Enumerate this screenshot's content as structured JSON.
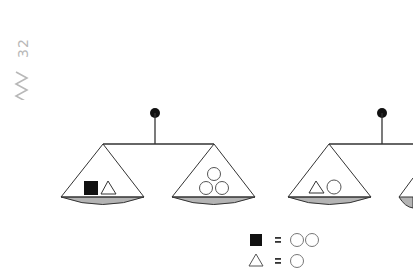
{
  "page": {
    "number": "32",
    "decoration": "zigzag"
  },
  "scales": [
    {
      "id": "scale-1",
      "left_pan": [
        "filled-square",
        "triangle"
      ],
      "right_pan": [
        "circle",
        "circle",
        "circle"
      ],
      "balanced": true
    },
    {
      "id": "scale-2",
      "left_pan": [
        "triangle",
        "circle"
      ],
      "right_pan": [
        "unknown (cut off)"
      ],
      "balanced": true
    }
  ],
  "legend": [
    {
      "symbol": "filled-square",
      "equals": "=",
      "value": [
        "circle",
        "circle"
      ]
    },
    {
      "symbol": "triangle",
      "equals": "=",
      "value": [
        "circle"
      ]
    }
  ],
  "colors": {
    "line": "#1a1a1a",
    "pan_fill": "#b4b4b4",
    "page_number": "#b8b8b8",
    "background": "#ffffff"
  }
}
